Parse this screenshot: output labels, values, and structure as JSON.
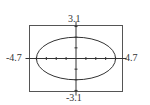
{
  "chart_data": {
    "type": "line",
    "title": "",
    "xlabel": "",
    "ylabel": "",
    "xlim": [
      -4.7,
      4.7
    ],
    "ylim": [
      -3.1,
      3.1
    ],
    "x_tick_step": 1,
    "y_tick_step": 1,
    "grid": false,
    "legend": null,
    "tick_labels": {
      "xmin": "-4.7",
      "xmax": "4.7",
      "ymin": "-3.1",
      "ymax": "3.1"
    },
    "series": [
      {
        "name": "ellipse",
        "equation": "x^2/16 + y^2/4 = 1",
        "center": [
          0,
          0
        ],
        "semi_axis_x": 4,
        "semi_axis_y": 2,
        "color": "#333333"
      }
    ]
  },
  "colors": {
    "frame": "#555555",
    "axis": "#333333",
    "curve": "#333333",
    "background": "#ffffff"
  }
}
